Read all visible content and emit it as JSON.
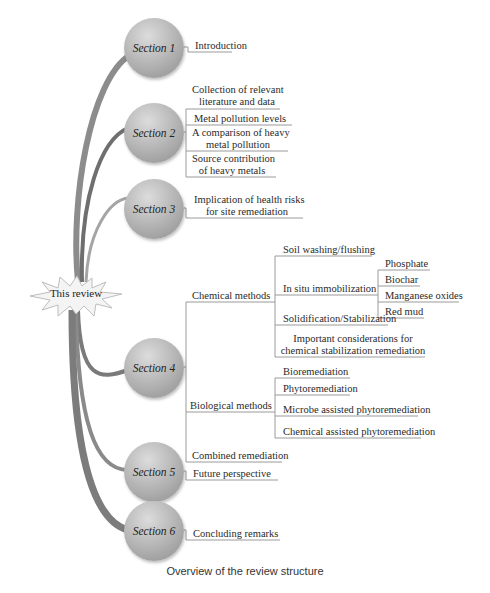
{
  "root": {
    "label": "This review"
  },
  "sections": [
    {
      "label": "Section 1",
      "children": [
        "Introduction"
      ]
    },
    {
      "label": "Section 2",
      "children": [
        "Collection of relevant literature and data",
        "Metal pollution levels",
        "A comparison of heavy metal pollution",
        "Source contribution of heavy metals"
      ]
    },
    {
      "label": "Section 3",
      "children": [
        "Implication of health risks for site remediation"
      ]
    },
    {
      "label": "Section 4",
      "children": [
        {
          "label": "Chemical methods",
          "children": [
            "Soil washing/flushing",
            {
              "label": "In situ immobilization",
              "children": [
                "Phosphate",
                "Biochar",
                "Manganese oxides",
                "Red mud"
              ]
            },
            "Solidification/Stabilization",
            "Important considerations for chemical stabilization remediation"
          ]
        },
        {
          "label": "Biological methods",
          "children": [
            "Bioremediation",
            "Phytoremediation",
            "Microbe assisted phytoremediation",
            "Chemical assisted phytoremediation"
          ]
        },
        "Combined remediation"
      ]
    },
    {
      "label": "Section 5",
      "children": [
        "Future perspective"
      ]
    },
    {
      "label": "Section 6",
      "children": [
        "Concluding remarks"
      ]
    }
  ],
  "labels": {
    "s1": "Section 1",
    "s2": "Section 2",
    "s3": "Section 3",
    "s4": "Section 4",
    "s5": "Section 5",
    "s6": "Section 6",
    "intro": "Introduction",
    "s2a1": "Collection of relevant",
    "s2a2": "literature and data",
    "s2b": "Metal pollution levels",
    "s2c1": "A comparison of heavy",
    "s2c2": "metal pollution",
    "s2d1": "Source contribution",
    "s2d2": "of heavy metals",
    "s3a1": "Implication of health risks",
    "s3a2": "for site remediation",
    "chem": "Chemical methods",
    "wash": "Soil washing/flushing",
    "insitu": "In situ immobilization",
    "phos": "Phosphate",
    "biochar": "Biochar",
    "mn": "Manganese oxides",
    "redmud": "Red mud",
    "solid": "Solidification/Stabilization",
    "imp1": "Important considerations for",
    "imp2": "chemical stabilization remediation",
    "bio": "Biological methods",
    "biorem": "Bioremediation",
    "phyto": "Phytoremediation",
    "microbe": "Microbe assisted phytoremediation",
    "chemphyto": "Chemical assisted phytoremediation",
    "combined": "Combined remediation",
    "future": "Future perspective",
    "concl": "Concluding remarks"
  },
  "caption": "Overview of the review structure"
}
